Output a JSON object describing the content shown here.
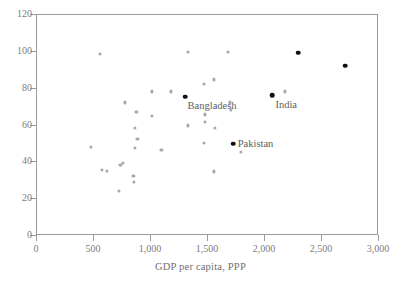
{
  "chart_data": {
    "type": "scatter",
    "title": "",
    "xlabel": "GDP per capita, PPP",
    "ylabel": "",
    "xlim": [
      0,
      3000
    ],
    "ylim": [
      0,
      120
    ],
    "grid": false,
    "legend": null,
    "xticks": [
      0,
      500,
      1000,
      1500,
      2000,
      2500,
      3000
    ],
    "xticklabels": [
      "0",
      "500",
      "1,000",
      "1,500",
      "2,000",
      "2,500",
      "3,000"
    ],
    "yticks": [
      0,
      20,
      40,
      60,
      80,
      100,
      120
    ],
    "yticklabels": [
      "0",
      "20",
      "40",
      "60",
      "80",
      "100",
      "120"
    ],
    "series": [
      {
        "name": "other-countries",
        "marker": "circle",
        "color": "#a8a8a8",
        "points": [
          {
            "x": 560,
            "y": 98.5
          },
          {
            "x": 1330,
            "y": 99.5
          },
          {
            "x": 1680,
            "y": 99.5
          },
          {
            "x": 1470,
            "y": 82.0
          },
          {
            "x": 1560,
            "y": 84.5
          },
          {
            "x": 1020,
            "y": 78.0
          },
          {
            "x": 1180,
            "y": 78.0
          },
          {
            "x": 2180,
            "y": 78.0
          },
          {
            "x": 780,
            "y": 72.0
          },
          {
            "x": 1700,
            "y": 72.0
          },
          {
            "x": 1710,
            "y": 68.0
          },
          {
            "x": 880,
            "y": 67.0
          },
          {
            "x": 1480,
            "y": 65.5
          },
          {
            "x": 1020,
            "y": 64.5
          },
          {
            "x": 1480,
            "y": 61.5
          },
          {
            "x": 1330,
            "y": 59.5
          },
          {
            "x": 870,
            "y": 58.0
          },
          {
            "x": 1570,
            "y": 58.0
          },
          {
            "x": 890,
            "y": 52.0
          },
          {
            "x": 1470,
            "y": 50.0
          },
          {
            "x": 480,
            "y": 48.0
          },
          {
            "x": 870,
            "y": 47.5
          },
          {
            "x": 1100,
            "y": 46.0
          },
          {
            "x": 1800,
            "y": 45.0
          },
          {
            "x": 760,
            "y": 39.0
          },
          {
            "x": 740,
            "y": 38.0
          },
          {
            "x": 580,
            "y": 35.5
          },
          {
            "x": 620,
            "y": 35.0
          },
          {
            "x": 1560,
            "y": 34.5
          },
          {
            "x": 855,
            "y": 32.0
          },
          {
            "x": 860,
            "y": 29.0
          },
          {
            "x": 730,
            "y": 24.0
          }
        ]
      },
      {
        "name": "highlighted-countries",
        "marker": "diamond",
        "color": "#111111",
        "points": [
          {
            "x": 1310,
            "y": 75.0,
            "label": "Bangladesh"
          },
          {
            "x": 2070,
            "y": 76.0,
            "label": "India"
          },
          {
            "x": 1730,
            "y": 49.5,
            "label": "Pakistan"
          },
          {
            "x": 2300,
            "y": 99.0,
            "label": ""
          },
          {
            "x": 2710,
            "y": 92.0,
            "label": ""
          }
        ]
      }
    ],
    "annotations": [
      {
        "text": "Bangladesh",
        "x": 1330,
        "y": 70.0,
        "anchor": "start"
      },
      {
        "text": "India",
        "x": 2100,
        "y": 70.5,
        "anchor": "start"
      },
      {
        "text": "Pakistan",
        "x": 1770,
        "y": 49.5,
        "anchor": "start"
      }
    ]
  },
  "colors": {
    "axis": "#9a9a9a",
    "tick_text": "#7c7c7c",
    "axis_title": "#6f6f6f",
    "point": "#a8a8a8",
    "point_highlight": "#111111",
    "annotation": "#5e5e5e",
    "background": "#ffffff"
  }
}
